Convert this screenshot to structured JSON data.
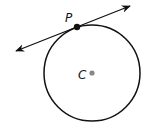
{
  "diagram": {
    "type": "geometry",
    "circle": {
      "center_label": "C",
      "cx": 92,
      "cy": 73,
      "r": 48
    },
    "point_tangent": {
      "label": "P",
      "x": 77,
      "y": 27
    },
    "tangent_line": {
      "x1": 16,
      "y1": 51,
      "x2": 130,
      "y2": 6,
      "arrows": "both"
    },
    "colors": {
      "stroke": "#111111",
      "center_dot": "#888888",
      "background": "#ffffff"
    }
  }
}
